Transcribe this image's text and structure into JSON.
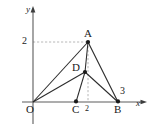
{
  "figure": {
    "kind": "coordinate-geometry-diagram",
    "background_color": "#ffffff",
    "line_color": "#2b2b2b",
    "dashed_color": "#9a9a9a",
    "axes": {
      "x_axis_label": "x",
      "y_axis_label": "y",
      "origin_label": "O"
    },
    "ticks": {
      "y_tick_label": "2",
      "x_tick_label": "2",
      "x_tick_label_right": "3"
    },
    "points": [
      {
        "name": "O",
        "label": "O",
        "x": 33,
        "y": 102,
        "dot": false
      },
      {
        "name": "A",
        "label": "A",
        "x": 88,
        "y": 42,
        "dot": true
      },
      {
        "name": "D",
        "label": "D",
        "x": 85,
        "y": 72,
        "dot": true
      },
      {
        "name": "C",
        "label": "C",
        "x": 76,
        "y": 102,
        "dot": true
      },
      {
        "name": "B",
        "label": "B",
        "x": 118,
        "y": 102,
        "dot": true
      }
    ],
    "segments": [
      {
        "from": "O",
        "to": "A"
      },
      {
        "from": "O",
        "to": "D"
      },
      {
        "from": "A",
        "to": "D"
      },
      {
        "from": "D",
        "to": "C"
      },
      {
        "from": "A",
        "to": "B"
      },
      {
        "from": "D",
        "to": "B"
      }
    ],
    "guides": [
      {
        "name": "horizontal-dashed-to-A",
        "from_x": 33,
        "from_y": 42,
        "to_x": 88,
        "to_y": 42
      },
      {
        "name": "vertical-dashed-from-A",
        "from_x": 88,
        "from_y": 42,
        "to_x": 88,
        "to_y": 102
      }
    ]
  }
}
